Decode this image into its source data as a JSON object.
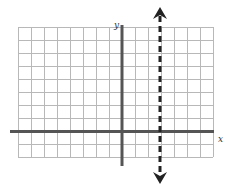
{
  "diagram": {
    "type": "coordinate-grid",
    "axis_labels": {
      "x": "x",
      "y": "y"
    },
    "grid": {
      "columns": 15,
      "rows": 10,
      "cell_px": 13,
      "left": 18,
      "top": 27,
      "color": "#b8b8b8"
    },
    "axes": {
      "y_axis_column": 8,
      "x_axis_row": 8,
      "color": "#555555"
    },
    "vertical_line": {
      "x_grid": 3,
      "style": "dashed",
      "arrows": "both",
      "color": "#222222"
    }
  },
  "colors": {
    "grid": "#b8b8b8",
    "axes": "#555555",
    "dashed_line": "#222222",
    "background": "#ffffff"
  }
}
